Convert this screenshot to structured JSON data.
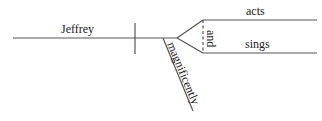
{
  "diagram": {
    "type": "sentence-diagram",
    "subject": "Jeffrey",
    "predicates": [
      "acts",
      "sings"
    ],
    "conjunction": "and",
    "modifier": "magnificently"
  },
  "colors": {
    "line": "#555555",
    "text": "#222222",
    "background": "#ffffff"
  }
}
